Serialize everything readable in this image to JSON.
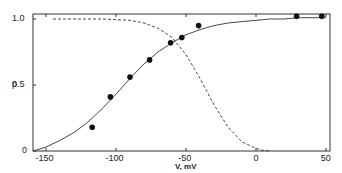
{
  "chart_data": {
    "type": "line",
    "title": "",
    "xlabel": "V, mV",
    "ylabel": "p",
    "xlim": [
      -159,
      52
    ],
    "ylim": [
      0,
      1.05
    ],
    "grid": false,
    "legend": null,
    "x_ticks": [
      -150,
      -100,
      -50,
      0,
      50
    ],
    "x_tick_labels": [
      "-150",
      "-100",
      "-50",
      "0",
      "50"
    ],
    "y_ticks": [
      0,
      0.5,
      1.0
    ],
    "y_tick_labels": [
      "0",
      "0.5",
      "1.0"
    ],
    "series": [
      {
        "name": "measured points",
        "style": "scatter",
        "marker": "filled-circle",
        "x": [
          -117,
          -104,
          -90,
          -76,
          -61,
          -53,
          -41,
          29,
          47
        ],
        "y": [
          0.18,
          0.41,
          0.56,
          0.69,
          0.82,
          0.86,
          0.95,
          1.02,
          1.02
        ]
      },
      {
        "name": "fitted activation curve",
        "style": "solid",
        "x": [
          -159,
          -150,
          -140,
          -130,
          -120,
          -110,
          -100,
          -90,
          -80,
          -70,
          -60,
          -50,
          -40,
          -30,
          -20,
          -10,
          0,
          10,
          20,
          30,
          40,
          50
        ],
        "y": [
          0.0,
          0.03,
          0.08,
          0.14,
          0.22,
          0.32,
          0.43,
          0.55,
          0.66,
          0.75,
          0.82,
          0.88,
          0.92,
          0.95,
          0.97,
          0.98,
          0.99,
          1.0,
          1.0,
          1.01,
          1.01,
          1.01
        ]
      },
      {
        "name": "inactivation curve",
        "style": "dashed",
        "x": [
          -145,
          -130,
          -110,
          -90,
          -80,
          -70,
          -60,
          -50,
          -40,
          -30,
          -20,
          -10,
          0,
          5,
          10
        ],
        "y": [
          1.0,
          1.0,
          1.0,
          0.99,
          0.97,
          0.93,
          0.86,
          0.73,
          0.55,
          0.35,
          0.18,
          0.07,
          0.02,
          0.005,
          0.0
        ]
      }
    ]
  }
}
